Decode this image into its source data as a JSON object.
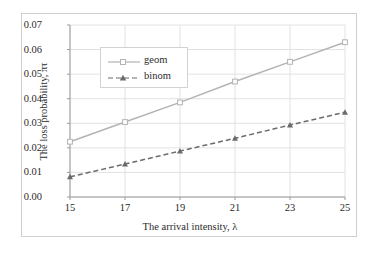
{
  "chart_data": {
    "type": "line",
    "title": "",
    "xlabel": "The arrival intensity, λ",
    "ylabel": "The loss probability, πτ",
    "x": [
      15,
      17,
      19,
      21,
      23,
      25
    ],
    "xtick_labels": [
      "15",
      "17",
      "19",
      "21",
      "23",
      "25"
    ],
    "ytick_labels": [
      "0.00",
      "0.01",
      "0.02",
      "0.03",
      "0.04",
      "0.05",
      "0.06",
      "0.07"
    ],
    "ytick_values": [
      0.0,
      0.01,
      0.02,
      0.03,
      0.04,
      0.05,
      0.06,
      0.07
    ],
    "xlim": [
      15,
      25
    ],
    "ylim": [
      0.0,
      0.07
    ],
    "grid": "horizontal-and-vertical",
    "legend_position": "upper-left-inside",
    "series": [
      {
        "name": "geom",
        "values": [
          0.0225,
          0.0305,
          0.0385,
          0.047,
          0.055,
          0.063
        ],
        "color": "#b3b3b3",
        "line_style": "solid",
        "marker": "square"
      },
      {
        "name": "binom",
        "values": [
          0.0082,
          0.0134,
          0.0187,
          0.0239,
          0.0293,
          0.0345
        ],
        "color": "#6b6b6b",
        "line_style": "dashed",
        "marker": "triangle"
      }
    ]
  },
  "colors": {
    "geom": "#b3b3b3",
    "binom": "#6b6b6b",
    "grid": "#e2e2e2",
    "axis": "#9a9a9a",
    "frame": "#cfcfcf",
    "text": "#2b2b2b"
  },
  "legend": {
    "items": [
      {
        "label": "geom"
      },
      {
        "label": "binom"
      }
    ]
  }
}
